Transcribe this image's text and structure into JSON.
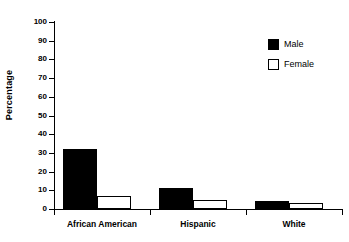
{
  "chart_data": {
    "type": "bar",
    "title": "",
    "subtitle": "",
    "xlabel": "",
    "ylabel": "Percentage",
    "categories": [
      "African American",
      "Hispanic",
      "White"
    ],
    "series": [
      {
        "name": "Male",
        "values": [
          32,
          11.5,
          4.5
        ],
        "color": "#000000",
        "fill": "solid"
      },
      {
        "name": "Female",
        "values": [
          7,
          5,
          3
        ],
        "color": "#FFFFFF",
        "fill": "outline"
      }
    ],
    "ylim": [
      0,
      100
    ],
    "ytick_labels": [
      "100",
      "90",
      "80",
      "70",
      "60",
      "50",
      "40",
      "30",
      "20",
      "10",
      "0"
    ],
    "ytick_values": [
      100,
      90,
      80,
      70,
      60,
      50,
      40,
      30,
      20,
      10,
      0
    ],
    "grid": false,
    "legend_position": "top-right",
    "legend_entries": [
      "Male",
      "Female"
    ],
    "annotations": []
  },
  "legend": {
    "items": [
      {
        "label": "Male",
        "swatch": "filled-black-square"
      },
      {
        "label": "Female",
        "swatch": "outlined-white-square"
      }
    ]
  },
  "axes": {
    "y_title": "Percentage",
    "y_ticks": [
      "100",
      "90",
      "80",
      "70",
      "60",
      "50",
      "40",
      "30",
      "20",
      "10",
      "0"
    ],
    "x_categories": [
      "African American",
      "Hispanic",
      "White"
    ]
  }
}
